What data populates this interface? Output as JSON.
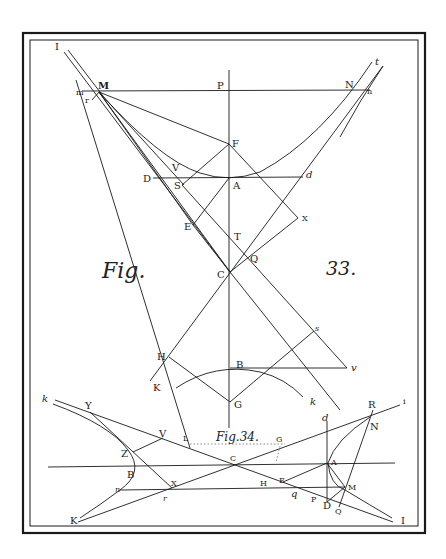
{
  "plate": {
    "background": "#ffffff",
    "ink": "#1a1a1a"
  },
  "fig33": {
    "caption_word": "Fig.",
    "caption_number": "33.",
    "labels": {
      "I": "I",
      "M": "M",
      "P": "P",
      "N": "N",
      "t": "t",
      "m": "m",
      "n": "n",
      "r": "r",
      "F": "F",
      "V": "V",
      "D": "D",
      "S": "S",
      "A": "A",
      "d": "d",
      "E": "E",
      "X": "X",
      "T": "T",
      "Q": "Q",
      "C": "C",
      "H": "H",
      "B": "B",
      "v": "v",
      "s": "s",
      "K": "K",
      "G": "G",
      "k": "k"
    }
  },
  "fig34": {
    "caption": "Fig.34.",
    "labels": {
      "k": "k",
      "Y": "Y",
      "V": "V",
      "L": "L",
      "G": "G",
      "Z": "Z",
      "B": "B",
      "C": "C",
      "X": "X",
      "n": "n",
      "r": "r",
      "K": "K",
      "H": "H",
      "E": "E",
      "q": "q",
      "d": "d",
      "A": "A",
      "R": "R",
      "N": "N",
      "i": "i",
      "M": "M",
      "P": "P",
      "D": "D",
      "Q": "Q",
      "I": "I"
    }
  }
}
